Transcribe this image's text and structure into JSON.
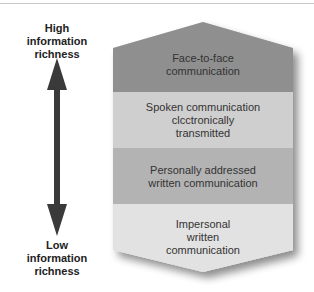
{
  "axis": {
    "high_label": [
      "High",
      "information",
      "richness"
    ],
    "low_label": [
      "Low",
      "information",
      "richness"
    ],
    "arrow_color": "#3a3a3a"
  },
  "bands": [
    {
      "lines": [
        "Face-to-face",
        "communication"
      ],
      "color": "#8f8f8f"
    },
    {
      "lines": [
        "Spoken communication",
        "clcctronically",
        "transmitted"
      ],
      "color": "#cfcfcf"
    },
    {
      "lines": [
        "Personally addressed",
        "written communication"
      ],
      "color": "#b3b3b3"
    },
    {
      "lines": [
        "Impersonal",
        "written",
        "communication"
      ],
      "color": "#e2e2e2"
    }
  ]
}
